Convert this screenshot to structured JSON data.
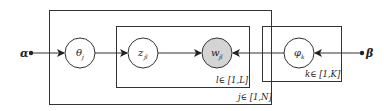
{
  "diagram": {
    "type": "plate-notation",
    "colors": {
      "stroke": "#333333",
      "observed_fill": "#d4d4d4",
      "latent_fill": "#ffffff"
    },
    "hyperparameters": {
      "alpha": {
        "label": "α"
      },
      "beta": {
        "label": "β"
      }
    },
    "nodes": {
      "theta": {
        "label": "θ",
        "sub": "j",
        "observed": false
      },
      "z": {
        "label": "z",
        "sub": "jl",
        "observed": false
      },
      "w": {
        "label": "w",
        "sub": "jl",
        "observed": true
      },
      "phi": {
        "label": "φ",
        "sub": "k",
        "observed": false
      }
    },
    "plates": {
      "outer": {
        "label": "j∈ [1,N]"
      },
      "inner": {
        "label": "l∈ [1,L]"
      },
      "topic": {
        "label": "k∈ [1,K]"
      }
    },
    "edges": [
      {
        "from": "alpha",
        "to": "theta"
      },
      {
        "from": "theta",
        "to": "z"
      },
      {
        "from": "z",
        "to": "w"
      },
      {
        "from": "phi",
        "to": "w"
      },
      {
        "from": "beta",
        "to": "phi"
      }
    ]
  }
}
